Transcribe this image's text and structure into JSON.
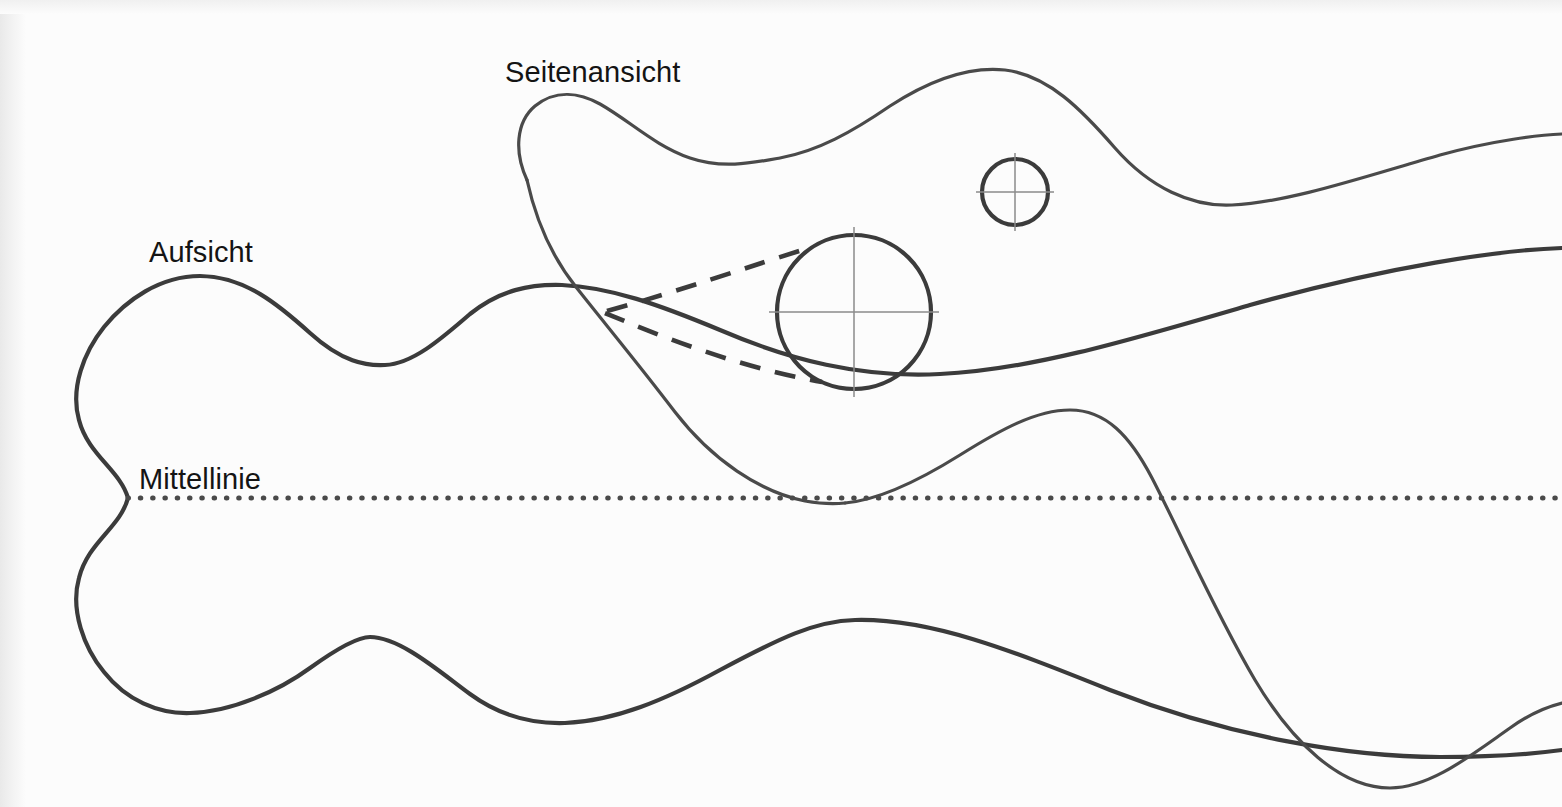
{
  "figure": {
    "background_color": "#fcfcfc",
    "line_color": "#3b3b3b",
    "thin_line_color": "#8b8b8b",
    "width": 1562,
    "height": 807
  },
  "labels": {
    "seitenansicht": "Seitenansicht",
    "aufsicht": "Aufsicht",
    "mittellinie": "Mittellinie"
  },
  "label_positions": {
    "seitenansicht": {
      "x": 505,
      "y": 82
    },
    "aufsicht": {
      "x": 149,
      "y": 262
    },
    "mittellinie": {
      "x": 139,
      "y": 489
    }
  },
  "centerline": {
    "name": "Mittellinie",
    "style": "dotted",
    "y": 498,
    "x_start": 128,
    "x_end": 1562,
    "dot_spacing_px": 12,
    "dot_diameter_px": 4
  },
  "circles": [
    {
      "name": "large-bore-circle",
      "cx": 854,
      "cy": 312,
      "r": 77,
      "crosshair": true,
      "crosshair_overshoot": 12
    },
    {
      "name": "small-bore-circle",
      "cx": 1015,
      "cy": 192,
      "r": 33,
      "crosshair": true,
      "crosshair_overshoot": 9
    }
  ],
  "hidden_lines": [
    {
      "name": "hidden-taper-upper",
      "from": {
        "x": 607,
        "y": 311
      },
      "to": {
        "x": 812,
        "y": 247
      }
    },
    {
      "name": "hidden-taper-lower",
      "from": {
        "x": 605,
        "y": 313
      },
      "to": {
        "x": 822,
        "y": 382
      }
    }
  ],
  "views": {
    "aufsicht": {
      "name": "Aufsicht",
      "description": "Top view, symmetric about the Mittellinie, waisted neck at left",
      "top_extrema": [
        {
          "x": 200,
          "y": 276
        },
        {
          "x": 385,
          "y": 365
        },
        {
          "x": 562,
          "y": 285
        }
      ],
      "bottom_extrema": [
        {
          "x": 190,
          "y": 713
        },
        {
          "x": 370,
          "y": 637
        },
        {
          "x": 565,
          "y": 723
        },
        {
          "x": 855,
          "y": 620
        }
      ],
      "waist": {
        "x": 128,
        "y": 498
      },
      "right_edge_exit_top_y": 250,
      "right_edge_exit_bottom_y": 750
    },
    "seitenansicht": {
      "name": "Seitenansicht",
      "description": "Side view, leading nose at left, crest over bore, long tail to right",
      "nose": {
        "x": 517,
        "y": 132
      },
      "top_extrema": [
        {
          "x": 590,
          "y": 100
        },
        {
          "x": 775,
          "y": 160
        },
        {
          "x": 1005,
          "y": 70
        },
        {
          "x": 1232,
          "y": 205
        }
      ],
      "bottom_extrema": [
        {
          "x": 845,
          "y": 503
        },
        {
          "x": 1070,
          "y": 410
        },
        {
          "x": 1400,
          "y": 788
        }
      ],
      "right_edge_exit_top_y": 137,
      "right_edge_exit_bottom_y": 706
    }
  }
}
